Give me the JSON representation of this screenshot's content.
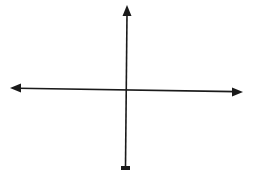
{
  "diagram": {
    "type": "coordinate-axes",
    "colors": {
      "background": "#ffffff",
      "axis": "#1a1a1a"
    },
    "axes": {
      "horizontal": {
        "x1": 10,
        "y1": 88,
        "x2": 243,
        "y2": 92,
        "arrows": [
          "left",
          "right"
        ]
      },
      "vertical": {
        "x1": 127,
        "y1": 5,
        "x2": 125,
        "y2": 168,
        "arrows": [
          "up",
          "down"
        ]
      }
    },
    "origin": {
      "x": 126,
      "y": 89
    }
  }
}
